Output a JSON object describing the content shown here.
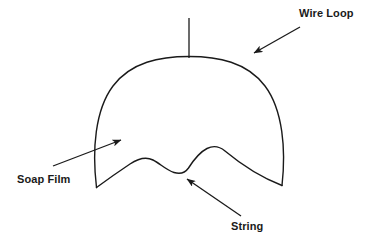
{
  "figure": {
    "width": 370,
    "height": 245,
    "background_color": "#ffffff",
    "stroke_color": "#1a1a1a",
    "text_color": "#1a1a1a"
  },
  "labels": {
    "wire_loop": "Wire Loop",
    "soap_film": "Soap Film",
    "string": "String"
  },
  "diagram": {
    "parts": [
      {
        "name": "support-stem",
        "label": "support stem"
      },
      {
        "name": "wire-loop-arc",
        "label": "Wire Loop"
      },
      {
        "name": "string-curve",
        "label": "String"
      },
      {
        "name": "soap-film-region",
        "label": "Soap Film"
      }
    ],
    "annotations": [
      {
        "name": "wire-loop",
        "text": "Wire Loop",
        "arrow_from": [
          300,
          27
        ],
        "arrow_to": [
          252,
          54
        ]
      },
      {
        "name": "soap-film",
        "text": "Soap Film",
        "arrow_from": [
          53,
          166
        ],
        "arrow_to": [
          123,
          139
        ]
      },
      {
        "name": "string",
        "text": "String",
        "arrow_from": [
          241,
          216
        ],
        "arrow_to": [
          185,
          178
        ]
      }
    ]
  }
}
